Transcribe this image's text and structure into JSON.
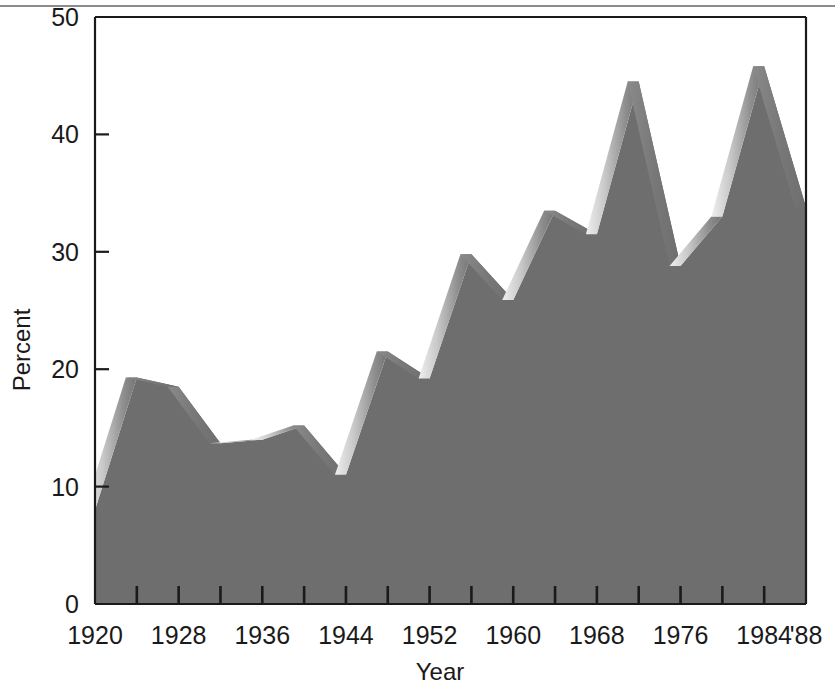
{
  "chart_data": {
    "type": "area",
    "title": "",
    "xlabel": "Year",
    "ylabel": "Percent",
    "ylim": [
      0,
      50
    ],
    "xlim": [
      1920,
      1988
    ],
    "grid": false,
    "legend": null,
    "style": "3d-ribbon-area",
    "yticks": [
      0,
      10,
      20,
      30,
      40,
      50
    ],
    "ytick_labels": [
      "0",
      "10",
      "20",
      "30",
      "40",
      "50"
    ],
    "xtick_labels": [
      "1920",
      "1928",
      "1936",
      "1944",
      "1952",
      "1960",
      "1968",
      "1976",
      "1984",
      "'88"
    ],
    "xtick_values": [
      1920,
      1928,
      1936,
      1944,
      1952,
      1960,
      1968,
      1976,
      1984,
      1988
    ],
    "x": [
      1920,
      1924,
      1928,
      1932,
      1936,
      1940,
      1944,
      1948,
      1952,
      1956,
      1960,
      1964,
      1968,
      1972,
      1976,
      1980,
      1984,
      1988
    ],
    "values": [
      8.0,
      19.3,
      18.5,
      13.7,
      14.0,
      15.2,
      11.0,
      21.5,
      19.2,
      29.8,
      25.9,
      33.5,
      31.5,
      44.5,
      28.8,
      33.0,
      45.8,
      33.8
    ],
    "series": [
      {
        "name": "Percent",
        "values": [
          8.0,
          19.3,
          18.5,
          13.7,
          14.0,
          15.2,
          11.0,
          21.5,
          19.2,
          29.8,
          25.9,
          33.5,
          31.5,
          44.5,
          28.8,
          33.0,
          45.8,
          33.8
        ]
      }
    ],
    "colors": {
      "fill": "#6e6e6e",
      "ribbon_light": "#d6d6d6",
      "ribbon_dark": "#6e6e6e",
      "axis": "#1a1a1a",
      "background": "#ffffff",
      "rule": "#8c8c8c"
    }
  }
}
